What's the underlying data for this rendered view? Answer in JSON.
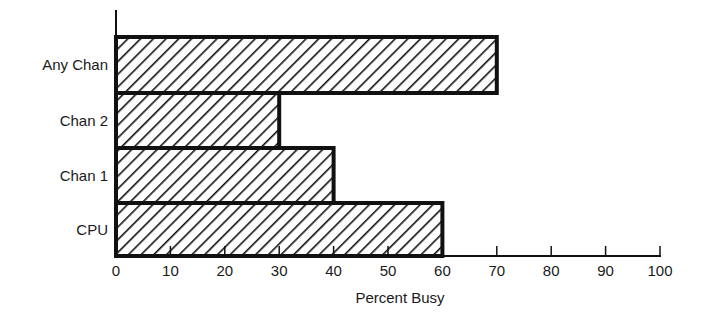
{
  "chart_data": {
    "type": "bar",
    "orientation": "horizontal",
    "title": "",
    "categories": [
      "Any Chan",
      "Chan 2",
      "Chan 1",
      "CPU"
    ],
    "values": [
      70,
      30,
      40,
      60
    ],
    "xlabel": "Percent Busy",
    "ylabel": "",
    "xlim": [
      0,
      100
    ],
    "xticks": [
      0,
      10,
      20,
      30,
      40,
      50,
      60,
      70,
      80,
      90,
      100
    ],
    "grid": false,
    "legend": null,
    "fill_pattern": "diagonal-hatch",
    "colors": {
      "bar_outline": "#111111",
      "hatch": "#111111",
      "background": "#ffffff"
    }
  }
}
